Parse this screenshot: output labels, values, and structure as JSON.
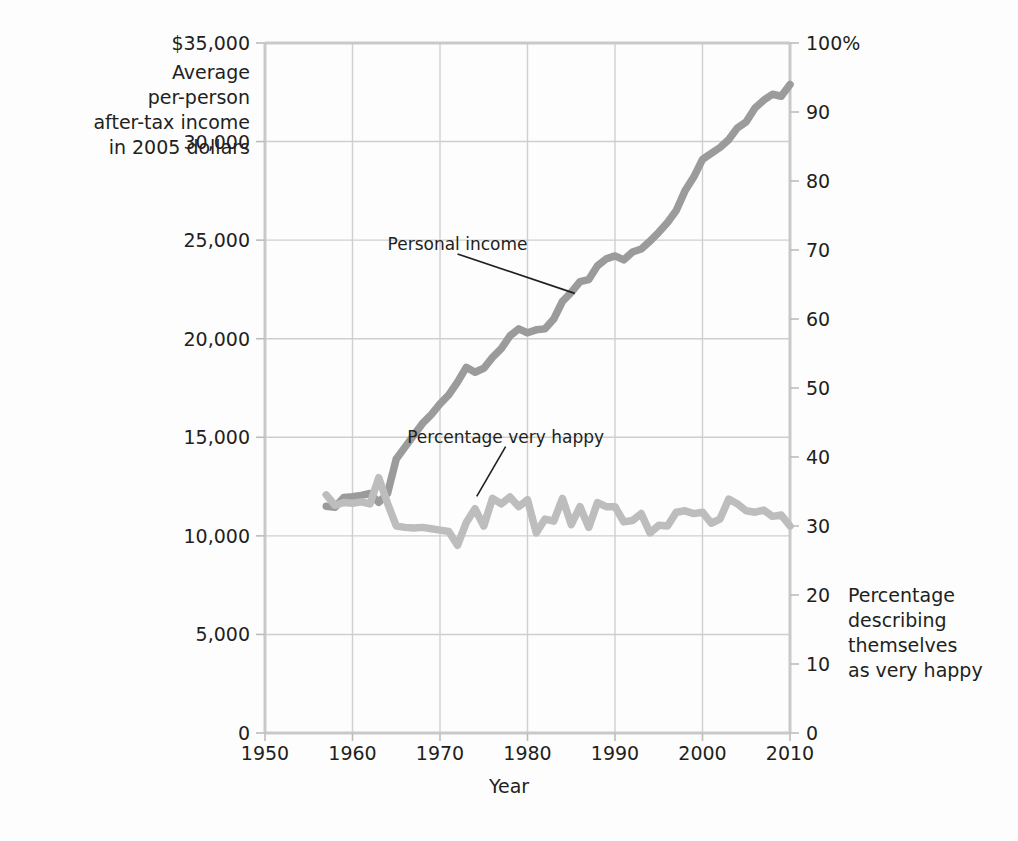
{
  "chart_data": {
    "type": "line",
    "title": "",
    "xlabel": "Year",
    "grid": true,
    "legend_position": "inline-annotations",
    "x_axis": {
      "label": "Year",
      "min": 1950,
      "max": 2010,
      "ticks": [
        1950,
        1960,
        1970,
        1980,
        1990,
        2000,
        2010
      ],
      "tick_labels": [
        "1950",
        "1960",
        "1970",
        "1980",
        "1990",
        "2000",
        "2010"
      ]
    },
    "y_axis_left": {
      "title": "Average\nper-person\nafter-tax income\nin 2005 dollars",
      "min": 0,
      "max": 35000,
      "ticks": [
        0,
        5000,
        10000,
        15000,
        20000,
        25000,
        30000,
        35000
      ],
      "tick_labels": [
        "0",
        "5,000",
        "10,000",
        "15,000",
        "20,000",
        "25,000",
        "30,000",
        "$35,000"
      ]
    },
    "y_axis_right": {
      "title": "Percentage\ndescribing\nthemselves\nas very happy",
      "min": 0,
      "max": 100,
      "ticks": [
        0,
        10,
        20,
        30,
        40,
        50,
        60,
        70,
        80,
        90,
        100
      ],
      "tick_labels": [
        "0",
        "10",
        "20",
        "30",
        "40",
        "50",
        "60",
        "70",
        "80",
        "90",
        "100%"
      ]
    },
    "series": [
      {
        "name": "Personal income",
        "axis": "left",
        "color": "#9b9b9b",
        "annotation": {
          "text": "Personal income",
          "label_x": 1972.0,
          "label_y": 24300,
          "point_x": 1985.4,
          "point_y": 22300
        },
        "points": [
          [
            1957,
            11500
          ],
          [
            1958,
            11450
          ],
          [
            1959,
            11950
          ],
          [
            1960,
            11980
          ],
          [
            1961,
            12050
          ],
          [
            1962,
            12150
          ],
          [
            1963,
            11700
          ],
          [
            1964,
            12150
          ],
          [
            1965,
            13900
          ],
          [
            1966,
            14500
          ],
          [
            1967,
            15100
          ],
          [
            1968,
            15700
          ],
          [
            1969,
            16150
          ],
          [
            1970,
            16700
          ],
          [
            1971,
            17150
          ],
          [
            1972,
            17800
          ],
          [
            1973,
            18550
          ],
          [
            1974,
            18300
          ],
          [
            1975,
            18500
          ],
          [
            1976,
            19050
          ],
          [
            1977,
            19500
          ],
          [
            1978,
            20150
          ],
          [
            1979,
            20500
          ],
          [
            1980,
            20300
          ],
          [
            1981,
            20450
          ],
          [
            1982,
            20500
          ],
          [
            1983,
            21000
          ],
          [
            1984,
            21900
          ],
          [
            1985,
            22350
          ],
          [
            1986,
            22900
          ],
          [
            1987,
            23000
          ],
          [
            1988,
            23700
          ],
          [
            1989,
            24050
          ],
          [
            1990,
            24200
          ],
          [
            1991,
            24000
          ],
          [
            1992,
            24400
          ],
          [
            1993,
            24550
          ],
          [
            1994,
            24950
          ],
          [
            1995,
            25400
          ],
          [
            1996,
            25900
          ],
          [
            1997,
            26500
          ],
          [
            1998,
            27500
          ],
          [
            1999,
            28200
          ],
          [
            2000,
            29100
          ],
          [
            2001,
            29400
          ],
          [
            2002,
            29700
          ],
          [
            2003,
            30100
          ],
          [
            2004,
            30700
          ],
          [
            2005,
            31000
          ],
          [
            2006,
            31700
          ],
          [
            2007,
            32100
          ],
          [
            2008,
            32400
          ],
          [
            2009,
            32300
          ],
          [
            2010,
            32900
          ]
        ]
      },
      {
        "name": "Percentage very happy",
        "axis": "right",
        "color": "#bdbdbd",
        "annotation": {
          "text": "Percentage very happy",
          "label_x": 1977.5,
          "label_y": 41.5,
          "point_x": 1974.2,
          "point_y": 34.3
        },
        "points": [
          [
            1957,
            34.5
          ],
          [
            1958,
            33.0
          ],
          [
            1959,
            33.4
          ],
          [
            1960,
            33.3
          ],
          [
            1961,
            33.5
          ],
          [
            1962,
            33.2
          ],
          [
            1963,
            37.0
          ],
          [
            1964,
            33.3
          ],
          [
            1965,
            30.0
          ],
          [
            1966,
            29.8
          ],
          [
            1967,
            29.7
          ],
          [
            1968,
            29.8
          ],
          [
            1969,
            29.6
          ],
          [
            1970,
            29.4
          ],
          [
            1971,
            29.2
          ],
          [
            1972,
            27.2
          ],
          [
            1973,
            30.5
          ],
          [
            1974,
            32.5
          ],
          [
            1975,
            30.0
          ],
          [
            1976,
            34.0
          ],
          [
            1977,
            33.2
          ],
          [
            1978,
            34.2
          ],
          [
            1979,
            32.8
          ],
          [
            1980,
            33.8
          ],
          [
            1981,
            29.0
          ],
          [
            1982,
            31.0
          ],
          [
            1983,
            30.7
          ],
          [
            1984,
            34.0
          ],
          [
            1985,
            30.2
          ],
          [
            1986,
            32.8
          ],
          [
            1987,
            29.8
          ],
          [
            1988,
            33.4
          ],
          [
            1989,
            32.8
          ],
          [
            1990,
            32.8
          ],
          [
            1991,
            30.6
          ],
          [
            1992,
            30.8
          ],
          [
            1993,
            31.8
          ],
          [
            1994,
            29.0
          ],
          [
            1995,
            30.1
          ],
          [
            1996,
            30.0
          ],
          [
            1997,
            32.0
          ],
          [
            1998,
            32.2
          ],
          [
            1999,
            31.8
          ],
          [
            2000,
            32.0
          ],
          [
            2001,
            30.4
          ],
          [
            2002,
            31.0
          ],
          [
            2003,
            33.9
          ],
          [
            2004,
            33.2
          ],
          [
            2005,
            32.2
          ],
          [
            2006,
            32.0
          ],
          [
            2007,
            32.3
          ],
          [
            2008,
            31.4
          ],
          [
            2009,
            31.6
          ],
          [
            2010,
            30.0
          ]
        ]
      }
    ]
  }
}
